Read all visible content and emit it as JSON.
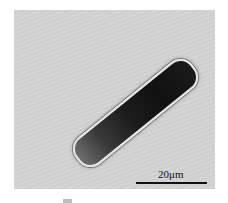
{
  "image": {
    "description": "Light micrograph of a rod-shaped cell with dark granular interior on a gray background",
    "scale_bar": {
      "label": "20μm"
    }
  }
}
